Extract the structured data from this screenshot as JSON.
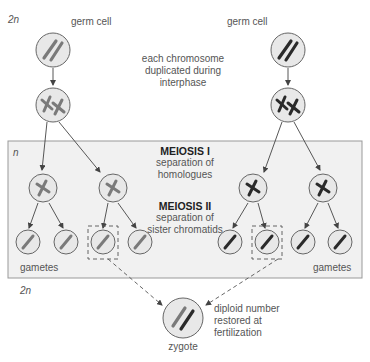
{
  "labels": {
    "ploidy_top": "2n",
    "ploidy_box": "n",
    "ploidy_bottom": "2n",
    "germ_cell_left": "germ cell",
    "germ_cell_right": "germ cell",
    "duplication_line1": "each chromosome",
    "duplication_line2": "duplicated during",
    "duplication_line3": "interphase",
    "meiosis1_title": "MEIOSIS I",
    "meiosis1_line1": "separation of",
    "meiosis1_line2": "homologues",
    "meiosis2_title": "MEIOSIS II",
    "meiosis2_line1": "separation of",
    "meiosis2_line2": "sister chromatids",
    "gametes_left": "gametes",
    "gametes_right": "gametes",
    "fertilization_line1": "diploid number",
    "fertilization_line2": "restored at",
    "fertilization_line3": "fertilization",
    "zygote": "zygote"
  },
  "colors": {
    "cell_fill": "#e8e8e8",
    "cell_stroke": "#666666",
    "paternal_chromosome": "#7a7a7a",
    "maternal_chromosome": "#2a2a2a",
    "box_fill": "#f1f1f1",
    "box_stroke": "#999999",
    "arrow": "#444444"
  }
}
